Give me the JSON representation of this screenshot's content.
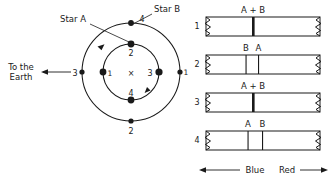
{
  "figure": {
    "title_hidden": "",
    "orbit_diagram": {
      "name": "binary-star-orbit-diagram",
      "center_marker": "×",
      "labels": {
        "star_a": "Star A",
        "star_b": "Star B",
        "to_the_earth_line1": "To the",
        "to_the_earth_line2": "Earth"
      },
      "inner_orbit_positions": [
        {
          "id": "inner-left",
          "label": "1",
          "angle_deg": 180
        },
        {
          "id": "inner-top",
          "label": "2",
          "angle_deg": 90
        },
        {
          "id": "inner-right",
          "label": "3",
          "angle_deg": 0
        },
        {
          "id": "inner-bottom",
          "label": "4",
          "angle_deg": 270
        }
      ],
      "outer_orbit_positions": [
        {
          "id": "outer-right",
          "label": "1",
          "angle_deg": 0
        },
        {
          "id": "outer-bottom",
          "label": "2",
          "angle_deg": 270
        },
        {
          "id": "outer-left",
          "label": "3",
          "angle_deg": 180
        },
        {
          "id": "outer-top",
          "label": "4",
          "angle_deg": 90
        }
      ]
    },
    "spectra": {
      "name": "spectrum-strips",
      "rows": [
        {
          "number": "1",
          "lines": [
            {
              "label": "A + B",
              "kind": "thick",
              "x_frac": 0.44
            }
          ]
        },
        {
          "number": "2",
          "lines": [
            {
              "label": "B",
              "kind": "thin",
              "x_frac": 0.375
            },
            {
              "label": "A",
              "kind": "thin",
              "x_frac": 0.5
            }
          ]
        },
        {
          "number": "3",
          "lines": [
            {
              "label": "A + B",
              "kind": "thick",
              "x_frac": 0.44
            }
          ]
        },
        {
          "number": "4",
          "lines": [
            {
              "label": "A",
              "kind": "thin",
              "x_frac": 0.4
            },
            {
              "label": "B",
              "kind": "thin",
              "x_frac": 0.545
            }
          ]
        }
      ],
      "axis": {
        "blue_label": "Blue",
        "red_label": "Red"
      }
    },
    "colors": {
      "ink": "#1a1a1a",
      "background": "#ffffff"
    }
  }
}
